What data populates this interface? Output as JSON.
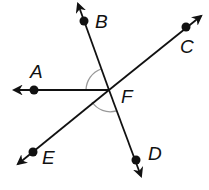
{
  "diagram": {
    "type": "geometry-angles",
    "colors": {
      "line": "#111111",
      "arc": "#999999",
      "background": "#ffffff"
    },
    "vertex": {
      "label": "F",
      "x": 109,
      "y": 90
    },
    "points": [
      {
        "label": "A",
        "x": 34,
        "y": 90
      },
      {
        "label": "B",
        "x": 84,
        "y": 21
      },
      {
        "label": "C",
        "x": 186,
        "y": 27
      },
      {
        "label": "D",
        "x": 136,
        "y": 160
      },
      {
        "label": "E",
        "x": 33,
        "y": 152
      }
    ],
    "labels": {
      "A": "A",
      "B": "B",
      "C": "C",
      "D": "D",
      "E": "E",
      "F": "F"
    },
    "lines": [
      {
        "name": "line-BD",
        "through": [
          "B",
          "D"
        ]
      },
      {
        "name": "line-EC",
        "through": [
          "E",
          "C"
        ]
      },
      {
        "name": "ray-FA",
        "through": [
          "F",
          "A"
        ]
      }
    ],
    "marked_angles": [
      "angle-AFB",
      "angle-EFD"
    ]
  }
}
